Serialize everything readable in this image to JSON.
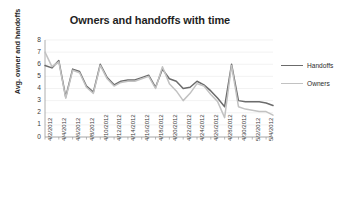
{
  "chart_data": {
    "type": "line",
    "title": "Owners and handoffs with time",
    "xlabel": "Incident start date",
    "ylabel": "Avg. owner and handoffs",
    "ylim": [
      0,
      8
    ],
    "yticks": [
      0,
      1,
      2,
      3,
      4,
      5,
      6,
      7,
      8
    ],
    "grid": true,
    "legend_position": "right",
    "tick_labels": [
      "4/2/2012",
      "4/4/2012",
      "4/6/2012",
      "4/8/2012",
      "4/10/2012",
      "4/12/2012",
      "4/14/2012",
      "4/16/2012",
      "4/18/2012",
      "4/20/2012",
      "4/22/2012",
      "4/24/2012",
      "4/26/2012",
      "4/28/2012",
      "4/30/2012",
      "5/2/2012",
      "5/4/2012"
    ],
    "x": [
      "4/2/2012",
      "4/3/2012",
      "4/4/2012",
      "4/5/2012",
      "4/6/2012",
      "4/7/2012",
      "4/8/2012",
      "4/9/2012",
      "4/10/2012",
      "4/11/2012",
      "4/12/2012",
      "4/13/2012",
      "4/14/2012",
      "4/15/2012",
      "4/16/2012",
      "4/17/2012",
      "4/18/2012",
      "4/19/2012",
      "4/20/2012",
      "4/21/2012",
      "4/22/2012",
      "4/23/2012",
      "4/24/2012",
      "4/25/2012",
      "4/26/2012",
      "4/27/2012",
      "4/28/2012",
      "4/29/2012",
      "4/30/2012",
      "5/1/2012",
      "5/2/2012",
      "5/3/2012",
      "5/4/2012",
      "5/5/2012"
    ],
    "series": [
      {
        "name": "Handoffs",
        "color": "#6b6b6b",
        "values": [
          5.9,
          5.7,
          6.3,
          3.3,
          5.6,
          5.4,
          4.2,
          3.7,
          6.0,
          4.9,
          4.3,
          4.6,
          4.7,
          4.7,
          4.9,
          5.1,
          4.1,
          5.6,
          4.8,
          4.6,
          4.0,
          4.1,
          4.6,
          4.3,
          3.8,
          3.2,
          2.5,
          6.0,
          3.0,
          2.9,
          2.9,
          2.9,
          2.8,
          2.6
        ]
      },
      {
        "name": "Owners",
        "color": "#c2c2c2",
        "values": [
          7.0,
          5.8,
          6.2,
          3.2,
          5.5,
          5.3,
          4.1,
          3.6,
          5.9,
          4.8,
          4.2,
          4.5,
          4.6,
          4.6,
          4.8,
          5.0,
          4.0,
          5.8,
          4.4,
          3.8,
          3.0,
          3.6,
          4.4,
          4.2,
          3.5,
          2.9,
          1.6,
          5.9,
          2.5,
          2.3,
          2.2,
          2.1,
          2.1,
          1.8
        ]
      }
    ]
  },
  "legend": {
    "items": [
      {
        "label": "Handoffs",
        "color": "#6b6b6b"
      },
      {
        "label": "Owners",
        "color": "#c2c2c2"
      }
    ]
  }
}
